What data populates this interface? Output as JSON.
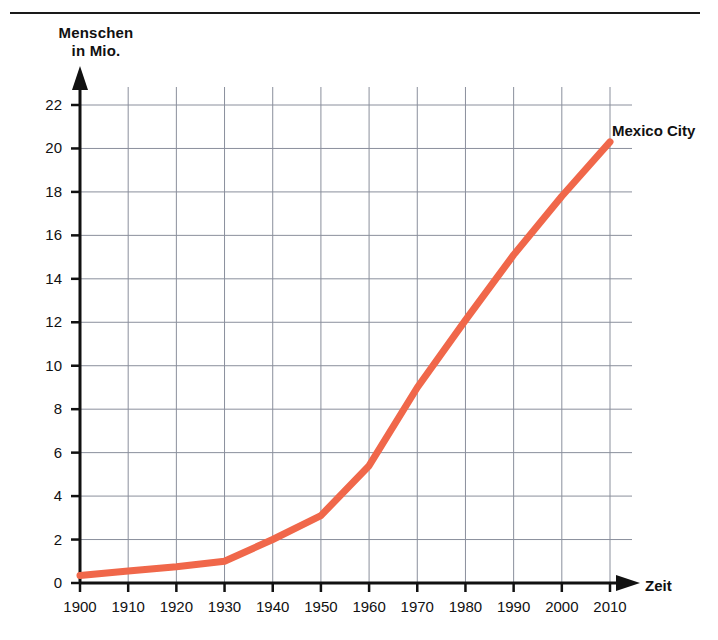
{
  "chart_data": {
    "type": "line",
    "title": "",
    "xlabel": "Zeit",
    "ylabel": "Menschen in Mio.",
    "ylabel_line1": "Menschen",
    "ylabel_line2": "in Mio.",
    "series_label": "Mexico City",
    "series_color": "#F0674A",
    "grid": true,
    "legend_position": "inline-right-end",
    "xlim": [
      1900,
      2010
    ],
    "ylim": [
      0,
      22
    ],
    "categories": [
      1900,
      1910,
      1920,
      1930,
      1940,
      1950,
      1960,
      1970,
      1980,
      1990,
      2000,
      2010
    ],
    "xtick_labels": [
      "1900",
      "1910",
      "1920",
      "1930",
      "1940",
      "1950",
      "1960",
      "1970",
      "1980",
      "1990",
      "2000",
      "2010"
    ],
    "ytick_labels": [
      "0",
      "2",
      "4",
      "6",
      "8",
      "10",
      "12",
      "14",
      "16",
      "18",
      "20",
      "22"
    ],
    "yticks": [
      0,
      2,
      4,
      6,
      8,
      10,
      12,
      14,
      16,
      18,
      20,
      22
    ],
    "series": [
      {
        "name": "Mexico City",
        "x": [
          1900,
          1910,
          1920,
          1930,
          1940,
          1950,
          1960,
          1970,
          1980,
          1990,
          2000,
          2010
        ],
        "values": [
          0.35,
          0.55,
          0.75,
          1.0,
          2.0,
          3.1,
          5.4,
          9.0,
          12.1,
          15.1,
          17.8,
          20.3
        ]
      }
    ]
  },
  "axes": {
    "x_arrow_label": "Zeit",
    "y_arrow": "y-axis-arrow"
  }
}
